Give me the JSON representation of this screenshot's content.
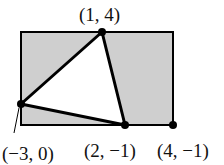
{
  "diagram": {
    "type": "geometry",
    "colors": {
      "shade": "#cfcfcf",
      "stroke": "#000000",
      "background": "#ffffff"
    },
    "rectangle": {
      "corners_label_visible": [
        "(4, −1)"
      ]
    },
    "triangle": {
      "vertices": [
        {
          "label": "(1, 4)",
          "x": 1,
          "y": 4
        },
        {
          "label": "(−3, 0)",
          "x": -3,
          "y": 0
        },
        {
          "label": "(2, −1)",
          "x": 2,
          "y": -1
        }
      ]
    },
    "points": [
      {
        "label": "(1, 4)",
        "x": 1,
        "y": 4
      },
      {
        "label": "(−3, 0)",
        "x": -3,
        "y": 0
      },
      {
        "label": "(2, −1)",
        "x": 2,
        "y": -1
      },
      {
        "label": "(4, −1)",
        "x": 4,
        "y": -1
      }
    ]
  },
  "labels": {
    "top": "(1, 4)",
    "left": "(−3, 0)",
    "bottom_mid": "(2, −1)",
    "bottom_right": "(4, −1)"
  }
}
